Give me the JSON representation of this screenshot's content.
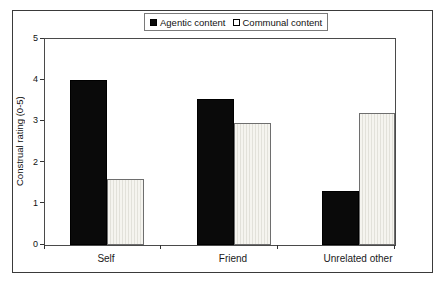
{
  "figure": {
    "background_color": "#ffffff",
    "frame_border_color": "#3a3a3a"
  },
  "legend": {
    "position": "top-center",
    "items": [
      {
        "label": "Agentic content",
        "swatch": "black-filled-square",
        "color": "#0a0a0a"
      },
      {
        "label": "Communal content",
        "swatch": "white-outlined-square",
        "color": "#ffffff"
      }
    ]
  },
  "chart_data": {
    "type": "bar",
    "title": "",
    "categories": [
      "Self",
      "Friend",
      "Unrelated other"
    ],
    "series": [
      {
        "name": "Agentic content",
        "values": [
          4.0,
          3.55,
          1.3
        ],
        "color": "#0a0a0a",
        "pattern": "solid"
      },
      {
        "name": "Communal content",
        "values": [
          1.6,
          2.95,
          3.2
        ],
        "color": "#f5f4ef",
        "pattern": "vertical-hatch"
      }
    ],
    "xlabel": "",
    "ylabel": "Construal rating (0-5)",
    "ylim": [
      0,
      5
    ],
    "y_ticks": [
      0,
      1,
      2,
      3,
      4,
      5
    ],
    "grid": false,
    "legend_position": "top-center"
  }
}
